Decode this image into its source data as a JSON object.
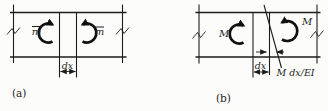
{
  "figure": {
    "background_color": "#fcfcfa",
    "line_color": "#1c1c1c",
    "panels": {
      "a": {
        "caption": "(a)",
        "left_moment_label": "m",
        "left_moment_has_overbar": true,
        "right_moment_label": "m",
        "right_moment_has_overbar": true,
        "width_label": "dx"
      },
      "b": {
        "caption": "(b)",
        "left_moment_label": "M",
        "right_moment_label": "M",
        "width_label": "dx",
        "rotation_label": "M dx/EI"
      }
    }
  }
}
